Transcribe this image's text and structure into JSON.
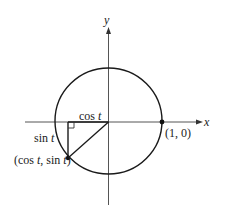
{
  "diagram": {
    "axes": {
      "x_label": "x",
      "y_label": "y"
    },
    "labels": {
      "cos_prefix": "cos ",
      "cos_var": "t",
      "sin_prefix": "sin ",
      "sin_var": "t",
      "point_open": "(cos ",
      "point_t1": "t",
      "point_mid": ", sin ",
      "point_t2": "t",
      "point_close": ")",
      "unit_point": "(1, 0)"
    },
    "colors": {
      "stroke": "#1a1a1a",
      "axis": "#555555",
      "background": "#ffffff"
    }
  }
}
